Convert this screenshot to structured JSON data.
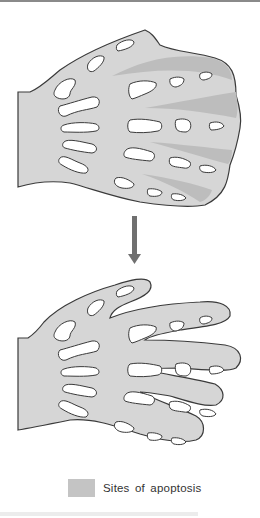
{
  "figure": {
    "panels": [
      {
        "id": "before",
        "label": "Webbed limb with interdigital tissue"
      },
      {
        "id": "after",
        "label": "Limb with separated digits"
      }
    ],
    "arrow": {
      "direction": "down"
    }
  },
  "legend": {
    "label": "Sites of apoptosis",
    "swatch_color": "#c4c4c4"
  },
  "colors": {
    "tissue_fill": "#d6d6d6",
    "apoptosis_fill": "#bdbdbd",
    "outline": "#3a3a3a",
    "bone_fill": "#ffffff",
    "arrow": "#707070"
  }
}
